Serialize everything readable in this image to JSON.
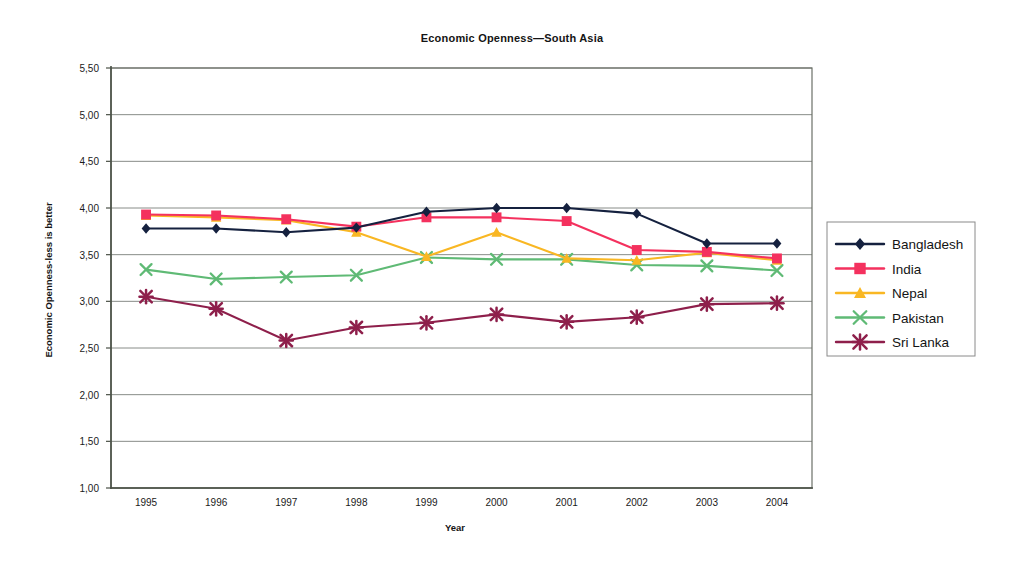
{
  "chart_data": {
    "type": "line",
    "title": "Economic Openness—South Asia",
    "xlabel": "Year",
    "ylabel": "Economic Openness-less is better",
    "categories": [
      "1995",
      "1996",
      "1997",
      "1998",
      "1999",
      "2000",
      "2001",
      "2002",
      "2003",
      "2004"
    ],
    "ylim": [
      1.0,
      5.5
    ],
    "ytick_labels": [
      "5,50",
      "5,00",
      "4,50",
      "4,00",
      "3,50",
      "3,00",
      "2,50",
      "2,00",
      "1,50",
      "1,00"
    ],
    "ytick_values": [
      5.5,
      5.0,
      4.5,
      4.0,
      3.5,
      3.0,
      2.5,
      2.0,
      1.5,
      1.0
    ],
    "grid": true,
    "legend_position": "right",
    "decimal_separator": ",",
    "series": [
      {
        "name": "Bangladesh",
        "color": "#15213f",
        "marker": "diamond",
        "values": [
          3.78,
          3.78,
          3.74,
          3.79,
          3.96,
          4.0,
          4.0,
          3.94,
          3.62,
          3.62
        ]
      },
      {
        "name": "India",
        "color": "#f4315e",
        "marker": "square",
        "values": [
          3.93,
          3.92,
          3.88,
          3.8,
          3.9,
          3.9,
          3.86,
          3.55,
          3.53,
          3.46
        ]
      },
      {
        "name": "Nepal",
        "color": "#f9b723",
        "marker": "triangle",
        "values": [
          3.92,
          3.9,
          3.87,
          3.74,
          3.48,
          3.74,
          3.46,
          3.44,
          3.52,
          3.44
        ]
      },
      {
        "name": "Pakistan",
        "color": "#5fba75",
        "marker": "cross",
        "values": [
          3.34,
          3.24,
          3.26,
          3.28,
          3.47,
          3.45,
          3.45,
          3.39,
          3.38,
          3.33
        ]
      },
      {
        "name": "Sri Lanka",
        "color": "#8e1f4b",
        "marker": "star",
        "values": [
          3.05,
          2.92,
          2.58,
          2.72,
          2.77,
          2.86,
          2.78,
          2.83,
          2.97,
          2.98
        ]
      }
    ]
  }
}
